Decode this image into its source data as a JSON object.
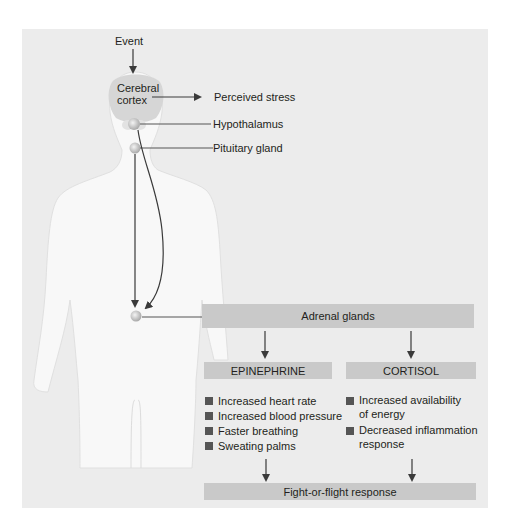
{
  "diagram": {
    "type": "stress-response-pathway",
    "labels": {
      "event": "Event",
      "cerebral_cortex": "Cerebral cortex",
      "cerebral_cortex_line1": "Cerebral",
      "cerebral_cortex_line2": "cortex",
      "perceived_stress": "Perceived stress",
      "hypothalamus": "Hypothalamus",
      "pituitary_gland": "Pituitary gland",
      "adrenal_glands": "Adrenal glands",
      "epinephrine": "EPINEPHRINE",
      "cortisol": "CORTISOL",
      "fight_or_flight": "Fight-or-flight response"
    },
    "epinephrine_effects": [
      "Increased heart rate",
      "Increased blood pressure",
      "Faster breathing",
      "Sweating palms"
    ],
    "cortisol_effects": [
      {
        "line1": "Increased availability",
        "line2": "of energy"
      },
      {
        "line1": "Decreased inflammation",
        "line2": "response"
      }
    ],
    "colors": {
      "panel_background": "#ececec",
      "body_silhouette": "#f8f8f8",
      "cortex": "#d6d6d6",
      "box_fill": "#c9c9c9",
      "bullet": "#555555",
      "arrow": "#3a3a3a"
    }
  }
}
